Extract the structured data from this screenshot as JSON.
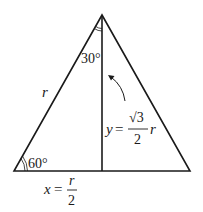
{
  "diagram": {
    "type": "30-60-90 triangle",
    "stroke_color": "#1a1a1a",
    "labels": {
      "top_angle": "30°",
      "bottom_left_angle": "60°",
      "hypotenuse": "r",
      "height_var": "y",
      "height_eq": "=",
      "height_num": "√3",
      "height_den": "2",
      "height_r": "r",
      "base_var": "x",
      "base_eq": "=",
      "base_num": "r",
      "base_den": "2"
    }
  }
}
